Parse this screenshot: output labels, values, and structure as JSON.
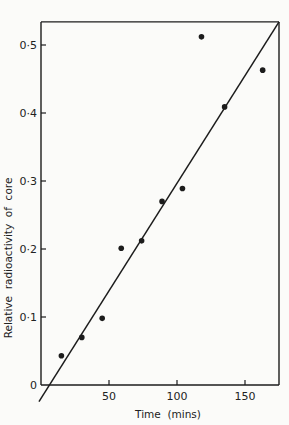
{
  "chart_data": {
    "type": "scatter",
    "title": "",
    "xlabel": "Time  (mins)",
    "ylabel": "Relative  radioactivity  of  core",
    "xlim": [
      0,
      175
    ],
    "ylim": [
      0,
      0.534
    ],
    "grid": false,
    "legend": null,
    "x_ticks": [
      50,
      100,
      150
    ],
    "x_tick_labels": [
      "50",
      "100",
      "150"
    ],
    "y_ticks": [
      0,
      0.1,
      0.2,
      0.3,
      0.4,
      0.5
    ],
    "y_tick_labels": [
      "0",
      "0·1",
      "0·2",
      "0·3",
      "0·4",
      "0·5"
    ],
    "series": [
      {
        "name": "measurements",
        "type": "scatter",
        "points": [
          {
            "x": 15,
            "y": 0.043
          },
          {
            "x": 30,
            "y": 0.07
          },
          {
            "x": 45,
            "y": 0.098
          },
          {
            "x": 59,
            "y": 0.201
          },
          {
            "x": 74,
            "y": 0.212
          },
          {
            "x": 89,
            "y": 0.27
          },
          {
            "x": 104,
            "y": 0.289
          },
          {
            "x": 118,
            "y": 0.512
          },
          {
            "x": 135,
            "y": 0.409
          },
          {
            "x": 163,
            "y": 0.463
          }
        ]
      },
      {
        "name": "fitted line",
        "type": "line",
        "points": [
          {
            "x": -1.5,
            "y": -0.0245
          },
          {
            "x": 175,
            "y": 0.534
          }
        ]
      }
    ]
  }
}
